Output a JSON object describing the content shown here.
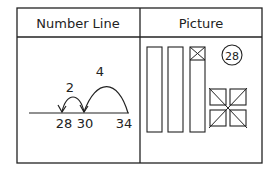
{
  "table": {
    "headers": [
      "Number Line",
      "Picture"
    ]
  },
  "number_line": {
    "jumps": [
      {
        "label": "4",
        "from": 34,
        "to": 30
      },
      {
        "label": "2",
        "from": 30,
        "to": 28
      }
    ],
    "ticks": [
      "28",
      "30",
      "34"
    ]
  },
  "picture": {
    "tens_bars": 3,
    "crossed_cells_in_third_bar": 1,
    "crossed_ones_squares": 4,
    "answer_circle": "28"
  },
  "colors": {
    "line": "#222222",
    "background": "#ffffff"
  }
}
